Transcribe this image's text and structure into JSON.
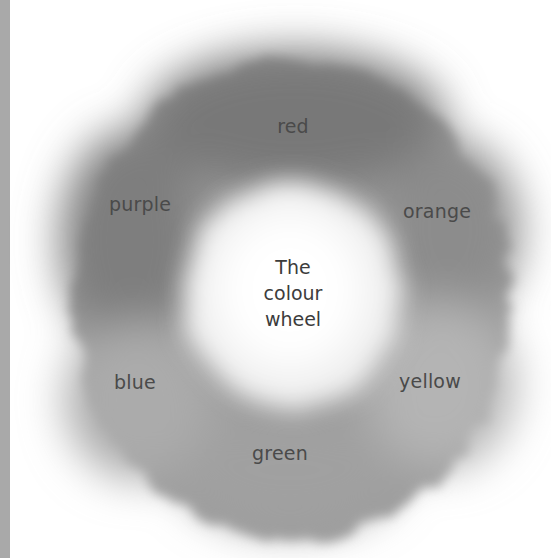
{
  "figure": {
    "title_lines": [
      "The",
      "colour",
      "wheel"
    ],
    "segments": [
      {
        "label": "red",
        "position": "top",
        "shade": "#7c7c7c"
      },
      {
        "label": "orange",
        "position": "upper-right",
        "shade": "#8e8e8e"
      },
      {
        "label": "yellow",
        "position": "lower-right",
        "shade": "#b2b2b2"
      },
      {
        "label": "green",
        "position": "bottom",
        "shade": "#a2a2a2"
      },
      {
        "label": "blue",
        "position": "lower-left",
        "shade": "#a8a8a8"
      },
      {
        "label": "purple",
        "position": "upper-left",
        "shade": "#828282"
      }
    ]
  },
  "colors": {
    "background": "#ffffff",
    "edge_strip": "#a9a9a9",
    "text": "#4a4a4a",
    "center": "#fbfbfb"
  }
}
